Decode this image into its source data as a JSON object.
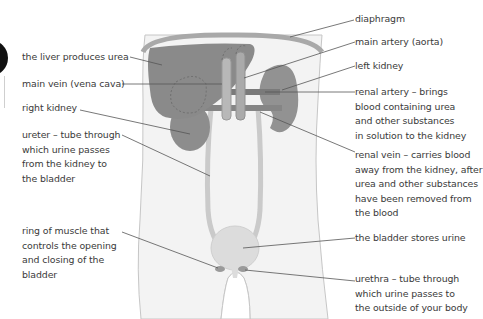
{
  "diagram": {
    "labels_left": [
      {
        "id": "liver",
        "text": "the liver produces urea",
        "lines": [
          "the liver produces urea"
        ]
      },
      {
        "id": "vena-cava",
        "text": "main vein (vena cava)",
        "lines": [
          "main vein (vena cava)"
        ]
      },
      {
        "id": "right-kidney",
        "text": "right kidney",
        "lines": [
          "right kidney"
        ]
      },
      {
        "id": "ureter",
        "text": "ureter – tube through which urine passes from the kidney to the bladder",
        "lines": [
          "ureter – tube through",
          "which urine passes",
          "from the kidney to",
          "the bladder"
        ]
      },
      {
        "id": "sphincter",
        "text": "ring of muscle that controls the opening and closing of the bladder",
        "lines": [
          "ring of muscle that",
          "controls the opening",
          "and closing of the",
          "bladder"
        ]
      }
    ],
    "labels_right": [
      {
        "id": "diaphragm",
        "text": "diaphragm",
        "lines": [
          "diaphragm"
        ]
      },
      {
        "id": "aorta",
        "text": "main artery (aorta)",
        "lines": [
          "main artery (aorta)"
        ]
      },
      {
        "id": "left-kidney",
        "text": "left kidney",
        "lines": [
          "left kidney"
        ]
      },
      {
        "id": "renal-artery",
        "text": "renal artery – brings blood containing urea and other substances in solution to the kidney",
        "lines": [
          "renal artery – brings",
          "blood containing urea",
          "and other substances",
          "in solution to the kidney"
        ]
      },
      {
        "id": "renal-vein",
        "text": "renal vein – carries blood away from the kidney, after urea and other substances have been removed from the blood",
        "lines": [
          "renal vein – carries blood",
          "away from the kidney, after",
          "urea and other substances",
          "have been removed from",
          "the blood"
        ]
      },
      {
        "id": "bladder",
        "text": "the bladder stores urine",
        "lines": [
          "the bladder stores urine"
        ]
      },
      {
        "id": "urethra",
        "text": "urethra – tube through which urine passes to the outside of your body",
        "lines": [
          "urethra – tube through",
          "which urine passes to",
          "the outside of your body"
        ]
      }
    ],
    "colors": {
      "body_fill": "#f2f2f2",
      "body_outline": "#c8c8c8",
      "organ_dark": "#8a8a8a",
      "organ_mid": "#9c9c9c",
      "vessel": "#b5b5b5",
      "bladder": "#dcdcdc",
      "leader_line": "#555555",
      "text": "#3a3a3a"
    }
  }
}
